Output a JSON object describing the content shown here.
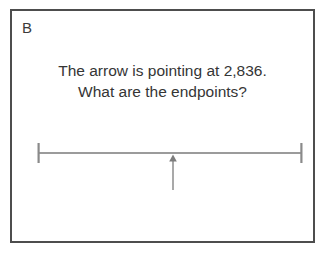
{
  "card": {
    "panel_letter": "B",
    "border_color": "#4d4d4d",
    "background_color": "#ffffff"
  },
  "prompt": {
    "line1": "The arrow is pointing at 2,836.",
    "line2": "What are the endpoints?",
    "text_color": "#353535"
  },
  "figure": {
    "type": "number-line",
    "line_color": "#9b9b9b",
    "arrow_color": "#8f8f8f",
    "left_endpoint_label": "",
    "right_endpoint_label": "",
    "arrow_value": "2,836",
    "arrow_position_fraction": 0.51,
    "tick_count": 2
  }
}
